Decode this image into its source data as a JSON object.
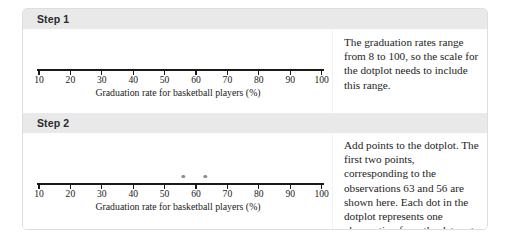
{
  "chart_data": {
    "type": "scatter",
    "title": "",
    "xlabel": "Graduation rate for basketball players (%)",
    "ylabel": "",
    "xlim": [
      5,
      105
    ],
    "ticks": [
      10,
      20,
      30,
      40,
      50,
      60,
      70,
      80,
      90,
      100
    ],
    "tick_labels": [
      "10",
      "20",
      "30",
      "40",
      "50",
      "60",
      "70",
      "80",
      "90",
      "100"
    ],
    "grid": false,
    "legend": "none",
    "panels": [
      {
        "step": "Step 1",
        "values": [],
        "note": "empty scale, no points plotted yet"
      },
      {
        "step": "Step 2",
        "values": [
          56,
          63
        ],
        "note": "first two observations plotted as dots above the axis"
      }
    ]
  },
  "steps": [
    {
      "header": "Step 1",
      "axis": {
        "label": "Graduation rate for basketball players (%)",
        "ticks": [
          "10",
          "20",
          "30",
          "40",
          "50",
          "60",
          "70",
          "80",
          "90",
          "100"
        ]
      },
      "dots": [],
      "text": "The graduation rates range from 8 to 100, so the scale for the dotplot needs to include this range."
    },
    {
      "header": "Step 2",
      "axis": {
        "label": "Graduation rate for basketball players (%)",
        "ticks": [
          "10",
          "20",
          "30",
          "40",
          "50",
          "60",
          "70",
          "80",
          "90",
          "100"
        ]
      },
      "dots": [
        56,
        63
      ],
      "text": "Add points to the dotplot. The first two points, corresponding to the observations 63 and 56 are shown here. Each dot in the dotplot represents one observation from the data set."
    }
  ],
  "colors": {
    "header_band": "#e9e9e9",
    "axis": "#1a1a1a",
    "dot": "#8e8e8e",
    "card_border": "#dedede",
    "text": "#1d1d1d"
  }
}
